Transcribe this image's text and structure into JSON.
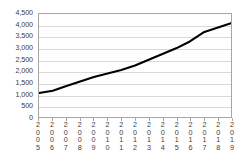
{
  "chart_data": {
    "type": "line",
    "title": "",
    "subtitle": "",
    "xlabel": "",
    "ylabel": "",
    "categories": [
      "2005",
      "2006",
      "2007",
      "2008",
      "2009",
      "2010",
      "2011",
      "2012",
      "2013",
      "2014",
      "2015",
      "2016",
      "2017",
      "2018",
      "2019"
    ],
    "values": [
      1050,
      1150,
      1350,
      1550,
      1750,
      1900,
      2050,
      2250,
      2500,
      2750,
      3000,
      3300,
      3700,
      3900,
      4100
    ],
    "series": [
      {
        "name": "",
        "values": [
          1050,
          1150,
          1350,
          1550,
          1750,
          1900,
          2050,
          2250,
          2500,
          2750,
          3000,
          3300,
          3700,
          3900,
          4100
        ]
      }
    ],
    "ylim": [
      0,
      4500
    ],
    "yticks": [
      0,
      500,
      1000,
      1500,
      2000,
      2500,
      3000,
      3500,
      4000,
      4500
    ],
    "ytick_labels": [
      "0",
      "500",
      "1,000",
      "1,500",
      "2,000",
      "2,500",
      "3,000",
      "3,500",
      "4,000",
      "4,500"
    ],
    "grid": true,
    "legend": "none",
    "line_color": "#000000",
    "grid_color": "#d9d9d9",
    "axis_color": "#a6a6a6",
    "plot_background": "#ffffff"
  }
}
